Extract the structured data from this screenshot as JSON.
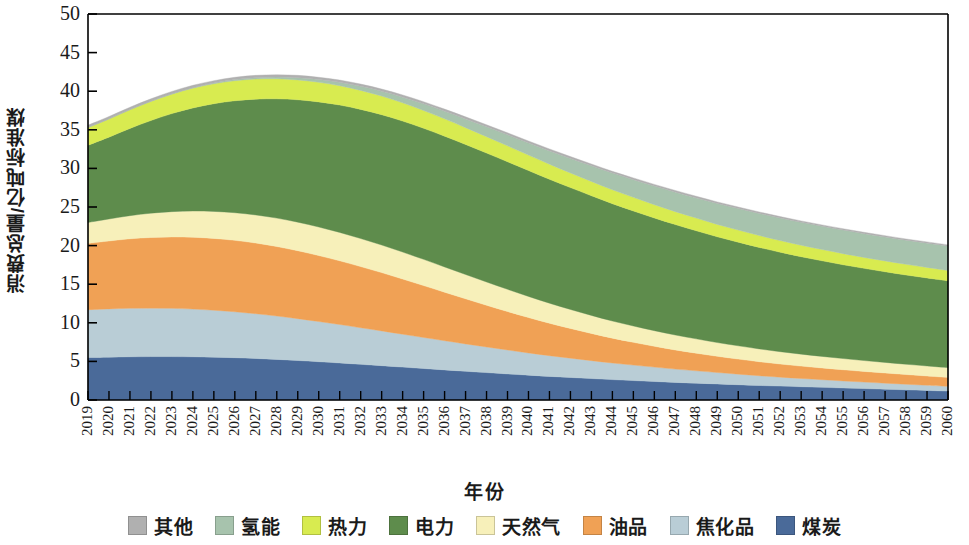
{
  "chart_data": {
    "type": "area",
    "stacked": true,
    "title": "",
    "xlabel": "年份",
    "ylabel": "消费总量/亿吨标准煤",
    "xlim": [
      2019,
      2060
    ],
    "ylim": [
      0,
      50
    ],
    "ytick_labels": [
      "0",
      "5",
      "10",
      "15",
      "20",
      "25",
      "30",
      "35",
      "40",
      "45",
      "50"
    ],
    "yticks": [
      0,
      5,
      10,
      15,
      20,
      25,
      30,
      35,
      40,
      45,
      50
    ],
    "grid": false,
    "legend_position": "bottom",
    "x": [
      2019,
      2020,
      2021,
      2022,
      2023,
      2024,
      2025,
      2026,
      2027,
      2028,
      2029,
      2030,
      2031,
      2032,
      2033,
      2034,
      2035,
      2036,
      2037,
      2038,
      2039,
      2040,
      2041,
      2042,
      2043,
      2044,
      2045,
      2046,
      2047,
      2048,
      2049,
      2050,
      2051,
      2052,
      2053,
      2054,
      2055,
      2056,
      2057,
      2058,
      2059,
      2060
    ],
    "categories": [
      "2019",
      "2020",
      "2021",
      "2022",
      "2023",
      "2024",
      "2025",
      "2026",
      "2027",
      "2028",
      "2029",
      "2030",
      "2031",
      "2032",
      "2033",
      "2034",
      "2035",
      "2036",
      "2037",
      "2038",
      "2039",
      "2040",
      "2041",
      "2042",
      "2043",
      "2044",
      "2045",
      "2046",
      "2047",
      "2048",
      "2049",
      "2050",
      "2051",
      "2052",
      "2053",
      "2054",
      "2055",
      "2056",
      "2057",
      "2058",
      "2059",
      "2060"
    ],
    "stack_order_bottom_to_top": [
      "煤炭",
      "焦化品",
      "油品",
      "天然气",
      "电力",
      "热力",
      "氢能",
      "其他"
    ],
    "series": [
      {
        "name": "煤炭",
        "color": "#4a6a99",
        "values": [
          5.5,
          5.55,
          5.6,
          5.62,
          5.62,
          5.6,
          5.55,
          5.48,
          5.38,
          5.26,
          5.12,
          4.96,
          4.8,
          4.62,
          4.45,
          4.26,
          4.08,
          3.9,
          3.72,
          3.55,
          3.38,
          3.22,
          3.06,
          2.92,
          2.78,
          2.64,
          2.52,
          2.4,
          2.28,
          2.18,
          2.08,
          1.98,
          1.88,
          1.8,
          1.72,
          1.64,
          1.56,
          1.48,
          1.4,
          1.32,
          1.24,
          1.15
        ]
      },
      {
        "name": "焦化品",
        "color": "#b9cdd6",
        "values": [
          6.2,
          6.25,
          6.28,
          6.28,
          6.25,
          6.18,
          6.08,
          5.95,
          5.8,
          5.62,
          5.42,
          5.2,
          4.98,
          4.74,
          4.5,
          4.26,
          4.02,
          3.78,
          3.55,
          3.32,
          3.1,
          2.88,
          2.68,
          2.5,
          2.32,
          2.15,
          2.0,
          1.86,
          1.72,
          1.6,
          1.48,
          1.37,
          1.26,
          1.16,
          1.07,
          0.99,
          0.91,
          0.84,
          0.78,
          0.72,
          0.67,
          0.62
        ]
      },
      {
        "name": "油品",
        "color": "#f0a155",
        "values": [
          8.6,
          8.8,
          9.0,
          9.15,
          9.25,
          9.3,
          9.3,
          9.25,
          9.15,
          9.0,
          8.8,
          8.55,
          8.25,
          7.92,
          7.55,
          7.15,
          6.72,
          6.28,
          5.84,
          5.4,
          4.98,
          4.58,
          4.2,
          3.85,
          3.52,
          3.22,
          2.95,
          2.7,
          2.48,
          2.28,
          2.1,
          1.95,
          1.82,
          1.7,
          1.6,
          1.52,
          1.45,
          1.38,
          1.32,
          1.26,
          1.2,
          1.15
        ]
      },
      {
        "name": "天然气",
        "color": "#f7f0ba",
        "values": [
          2.7,
          2.85,
          3.0,
          3.15,
          3.28,
          3.4,
          3.5,
          3.58,
          3.64,
          3.68,
          3.7,
          3.7,
          3.68,
          3.64,
          3.58,
          3.5,
          3.4,
          3.28,
          3.15,
          3.02,
          2.88,
          2.74,
          2.6,
          2.46,
          2.34,
          2.22,
          2.12,
          2.02,
          1.94,
          1.86,
          1.78,
          1.72,
          1.66,
          1.6,
          1.55,
          1.5,
          1.45,
          1.41,
          1.37,
          1.33,
          1.3,
          1.27
        ]
      },
      {
        "name": "电力",
        "color": "#5e8c4c",
        "values": [
          10.0,
          10.6,
          11.3,
          12.0,
          12.7,
          13.35,
          13.95,
          14.5,
          15.0,
          15.45,
          15.85,
          16.2,
          16.5,
          16.72,
          16.88,
          16.96,
          16.98,
          16.94,
          16.84,
          16.7,
          16.52,
          16.3,
          16.05,
          15.78,
          15.5,
          15.2,
          14.9,
          14.6,
          14.3,
          14.0,
          13.7,
          13.42,
          13.14,
          12.88,
          12.62,
          12.38,
          12.15,
          11.94,
          11.74,
          11.56,
          11.4,
          11.25
        ]
      },
      {
        "name": "热力",
        "color": "#d8eb50",
        "values": [
          2.3,
          2.36,
          2.42,
          2.48,
          2.52,
          2.56,
          2.58,
          2.6,
          2.6,
          2.59,
          2.57,
          2.54,
          2.5,
          2.46,
          2.41,
          2.36,
          2.3,
          2.24,
          2.18,
          2.12,
          2.06,
          2.0,
          1.95,
          1.9,
          1.85,
          1.8,
          1.76,
          1.72,
          1.68,
          1.64,
          1.6,
          1.57,
          1.54,
          1.51,
          1.48,
          1.46,
          1.44,
          1.42,
          1.4,
          1.38,
          1.36,
          1.34
        ]
      },
      {
        "name": "氢能",
        "color": "#a7c3ad",
        "values": [
          0.0,
          0.01,
          0.02,
          0.03,
          0.05,
          0.07,
          0.1,
          0.14,
          0.18,
          0.23,
          0.29,
          0.36,
          0.44,
          0.53,
          0.63,
          0.74,
          0.86,
          0.99,
          1.13,
          1.28,
          1.43,
          1.58,
          1.73,
          1.88,
          2.02,
          2.16,
          2.29,
          2.41,
          2.52,
          2.62,
          2.71,
          2.79,
          2.86,
          2.92,
          2.97,
          3.01,
          3.05,
          3.08,
          3.11,
          3.13,
          3.15,
          3.17
        ]
      },
      {
        "name": "其他",
        "color": "#b0b0b0",
        "values": [
          0.3,
          0.3,
          0.3,
          0.3,
          0.3,
          0.3,
          0.3,
          0.3,
          0.3,
          0.3,
          0.3,
          0.29,
          0.29,
          0.29,
          0.28,
          0.28,
          0.28,
          0.27,
          0.27,
          0.26,
          0.26,
          0.25,
          0.25,
          0.24,
          0.24,
          0.23,
          0.23,
          0.22,
          0.22,
          0.21,
          0.21,
          0.2,
          0.2,
          0.19,
          0.19,
          0.18,
          0.18,
          0.17,
          0.17,
          0.16,
          0.16,
          0.15
        ]
      }
    ],
    "totals": [
      35.6,
      36.72,
      37.92,
      39.01,
      39.97,
      40.76,
      41.36,
      41.8,
      42.05,
      42.13,
      42.05,
      41.8,
      41.44,
      40.92,
      40.28,
      39.51,
      38.64,
      37.68,
      36.68,
      35.65,
      34.61,
      33.55,
      32.52,
      31.53,
      30.57,
      29.62,
      28.77,
      27.93,
      27.14,
      26.39,
      25.66,
      25.0,
      24.36,
      23.76,
      23.2,
      22.68,
      22.19,
      21.72,
      21.29,
      20.86,
      20.48,
      19.95
    ]
  },
  "legend": {
    "items": [
      {
        "label": "其他",
        "color": "#b0b0b0"
      },
      {
        "label": "氢能",
        "color": "#a7c3ad"
      },
      {
        "label": "热力",
        "color": "#d8eb50"
      },
      {
        "label": "电力",
        "color": "#5e8c4c"
      },
      {
        "label": "天然气",
        "color": "#f7f0ba"
      },
      {
        "label": "油品",
        "color": "#f0a155"
      },
      {
        "label": "焦化品",
        "color": "#b9cdd6"
      },
      {
        "label": "煤炭",
        "color": "#4a6a99"
      }
    ]
  },
  "axes": {
    "y_title": "消费总量/亿吨标准煤",
    "x_title": "年份"
  }
}
